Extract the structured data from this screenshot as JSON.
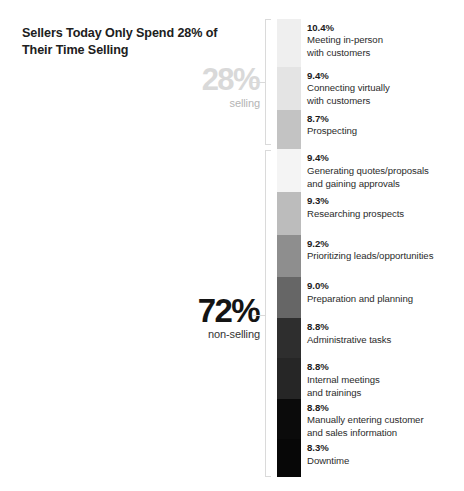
{
  "title": "Sellers Today Only Spend 28%\nof Their Time Selling",
  "groups": {
    "selling": {
      "percent": "28%",
      "label": "selling",
      "color": "#d9d9d9"
    },
    "non_selling": {
      "percent": "72%",
      "label": "non-selling",
      "color": "#141414"
    }
  },
  "chart_data": {
    "type": "bar",
    "title": "Sellers Today Only Spend 28% of Their Time Selling",
    "xlabel": "",
    "ylabel": "Share of seller time (%)",
    "orientation": "vertical-stacked",
    "grid": false,
    "legend": "none",
    "categories": [
      "Meeting in-person with customers",
      "Connecting virtually with customers",
      "Prospecting",
      "Generating quotes/proposals and gaining approvals",
      "Researching prospects",
      "Prioritizing leads/opportunities",
      "Preparation and planning",
      "Administrative tasks",
      "Internal meetings and trainings",
      "Manually entering customer and sales information",
      "Downtime"
    ],
    "values": [
      10.4,
      9.4,
      8.7,
      9.4,
      9.3,
      9.2,
      9.0,
      8.8,
      8.8,
      8.8,
      8.3
    ],
    "groups": [
      {
        "name": "selling",
        "total": 28,
        "segment_indices": [
          0,
          1,
          2
        ]
      },
      {
        "name": "non-selling",
        "total": 72,
        "segment_indices": [
          3,
          4,
          5,
          6,
          7,
          8,
          9,
          10
        ]
      }
    ],
    "segments": [
      {
        "pct": "10.4%",
        "name": "Meeting in-person\nwith customers",
        "value": 10.4,
        "color": "#efefef",
        "group": "selling"
      },
      {
        "pct": "9.4%",
        "name": "Connecting virtually\nwith customers",
        "value": 9.4,
        "color": "#e4e4e4",
        "group": "selling"
      },
      {
        "pct": "8.7%",
        "name": "Prospecting",
        "value": 8.7,
        "color": "#c3c3c3",
        "group": "selling"
      },
      {
        "pct": "9.4%",
        "name": "Generating quotes/proposals\nand gaining approvals",
        "value": 9.4,
        "color": "#f4f4f4",
        "group": "non-selling"
      },
      {
        "pct": "9.3%",
        "name": "Researching prospects",
        "value": 9.3,
        "color": "#bcbcbc",
        "group": "non-selling"
      },
      {
        "pct": "9.2%",
        "name": "Prioritizing leads/opportunities",
        "value": 9.2,
        "color": "#8e8e8e",
        "group": "non-selling"
      },
      {
        "pct": "9.0%",
        "name": "Preparation and planning",
        "value": 9.0,
        "color": "#666666",
        "group": "non-selling"
      },
      {
        "pct": "8.8%",
        "name": "Administrative tasks",
        "value": 8.8,
        "color": "#2e2e2e",
        "group": "non-selling"
      },
      {
        "pct": "8.8%",
        "name": "Internal meetings\nand trainings",
        "value": 8.8,
        "color": "#262626",
        "group": "non-selling"
      },
      {
        "pct": "8.8%",
        "name": "Manually entering customer\nand sales information",
        "value": 8.8,
        "color": "#0b0b0b",
        "group": "non-selling"
      },
      {
        "pct": "8.3%",
        "name": "Downtime",
        "value": 8.3,
        "color": "#070707",
        "group": "non-selling"
      }
    ]
  }
}
